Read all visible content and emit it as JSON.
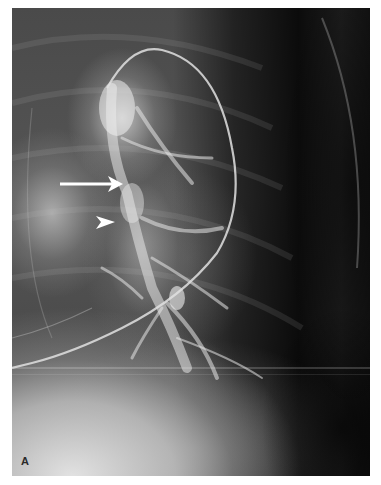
{
  "figure": {
    "panel_label": "A",
    "annotations": [
      {
        "type": "arrow",
        "direction": "right",
        "color": "#ffffff"
      },
      {
        "type": "arrowhead",
        "direction": "right",
        "color": "#ffffff"
      }
    ]
  }
}
